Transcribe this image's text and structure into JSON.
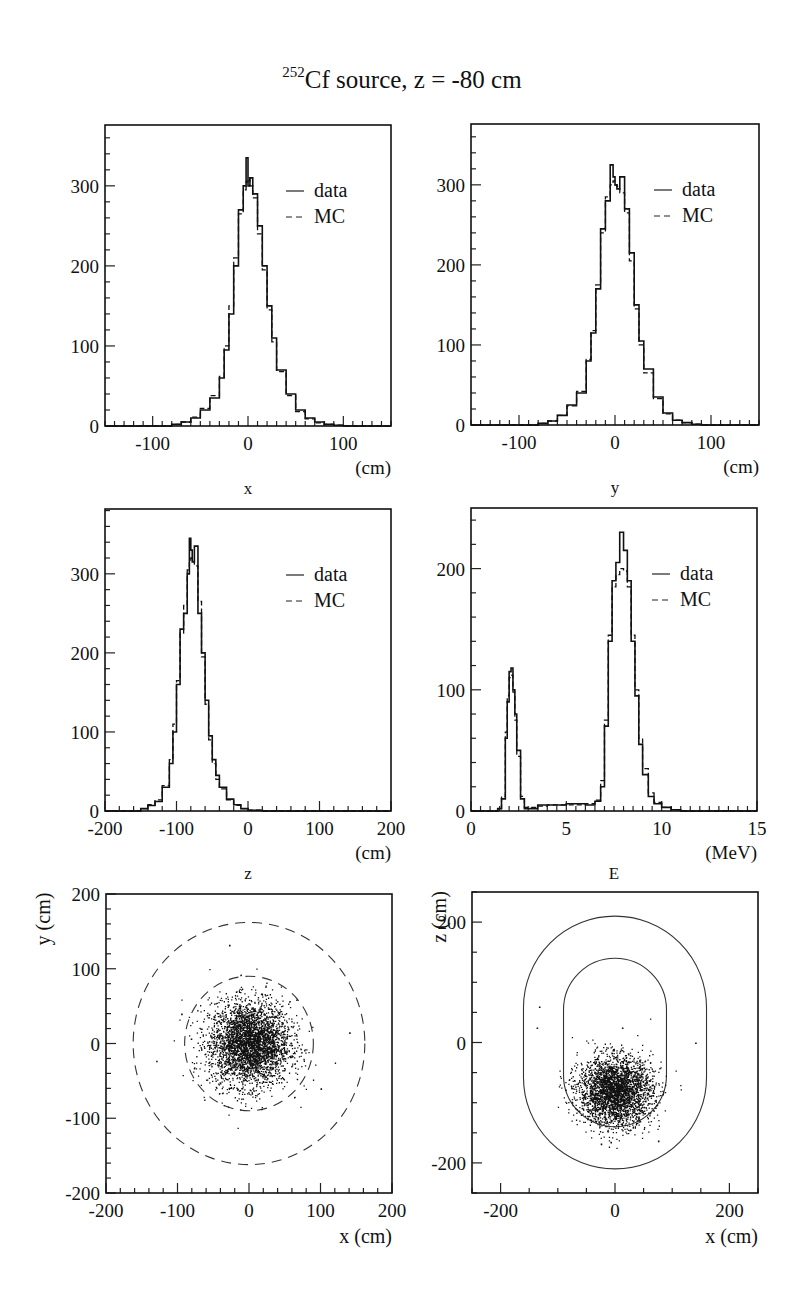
{
  "figure": {
    "title_superscript": "252",
    "title_main": "Cf source, z = -80 cm"
  },
  "chart_data": [
    {
      "id": "x",
      "type": "line",
      "subtype": "histogram",
      "title": "",
      "xlabel": "x",
      "xunit": "(cm)",
      "ylabel": "",
      "xlim": [
        -150,
        150
      ],
      "ylim": [
        0,
        376
      ],
      "xticks": [
        -100,
        0,
        100
      ],
      "yticks": [
        0,
        100,
        200,
        300
      ],
      "legend": [
        {
          "name": "data",
          "style": "solid"
        },
        {
          "name": "MC",
          "style": "dashed"
        }
      ],
      "legend_position": "upper right",
      "grid": false,
      "x": [
        -150,
        -90,
        -80,
        -70,
        -60,
        -50,
        -40,
        -30,
        -25,
        -20,
        -15,
        -10,
        -5,
        -2,
        0,
        2,
        5,
        10,
        15,
        20,
        25,
        30,
        40,
        50,
        60,
        70,
        80,
        90,
        100,
        150
      ],
      "series": [
        {
          "name": "data",
          "values": [
            0,
            0,
            2,
            5,
            10,
            20,
            35,
            60,
            95,
            140,
            200,
            270,
            300,
            335,
            300,
            310,
            290,
            250,
            200,
            150,
            110,
            70,
            40,
            20,
            10,
            5,
            2,
            1,
            0,
            0
          ]
        },
        {
          "name": "MC",
          "values": [
            0,
            0,
            2,
            5,
            11,
            22,
            38,
            62,
            100,
            150,
            210,
            265,
            295,
            305,
            310,
            300,
            285,
            240,
            195,
            145,
            105,
            68,
            38,
            18,
            9,
            4,
            2,
            1,
            0,
            0
          ]
        }
      ]
    },
    {
      "id": "y",
      "type": "line",
      "subtype": "histogram",
      "title": "",
      "xlabel": "y",
      "xunit": "(cm)",
      "ylabel": "",
      "xlim": [
        -150,
        150
      ],
      "ylim": [
        0,
        376
      ],
      "xticks": [
        -100,
        0,
        100
      ],
      "yticks": [
        0,
        100,
        200,
        300
      ],
      "legend": [
        {
          "name": "data",
          "style": "solid"
        },
        {
          "name": "MC",
          "style": "dashed"
        }
      ],
      "legend_position": "upper right",
      "grid": false,
      "x": [
        -150,
        -90,
        -80,
        -70,
        -60,
        -50,
        -40,
        -30,
        -25,
        -20,
        -15,
        -10,
        -5,
        -2,
        0,
        2,
        5,
        10,
        15,
        20,
        25,
        30,
        40,
        50,
        60,
        70,
        80,
        90,
        100,
        150
      ],
      "series": [
        {
          "name": "data",
          "values": [
            0,
            0,
            2,
            5,
            12,
            25,
            40,
            80,
            115,
            170,
            245,
            280,
            325,
            310,
            300,
            295,
            310,
            270,
            215,
            150,
            105,
            70,
            35,
            15,
            6,
            3,
            1,
            0,
            0,
            0
          ]
        },
        {
          "name": "MC",
          "values": [
            0,
            0,
            2,
            5,
            12,
            24,
            42,
            82,
            118,
            175,
            240,
            285,
            300,
            305,
            300,
            298,
            290,
            265,
            205,
            145,
            100,
            65,
            33,
            14,
            6,
            3,
            1,
            0,
            0,
            0
          ]
        }
      ]
    },
    {
      "id": "z",
      "type": "line",
      "subtype": "histogram",
      "title": "",
      "xlabel": "z",
      "xunit": "(cm)",
      "ylabel": "",
      "xlim": [
        -200,
        200
      ],
      "ylim": [
        0,
        382
      ],
      "xticks": [
        -200,
        -100,
        0,
        100,
        200
      ],
      "yticks": [
        0,
        100,
        200,
        300
      ],
      "legend": [
        {
          "name": "data",
          "style": "solid"
        },
        {
          "name": "MC",
          "style": "dashed"
        }
      ],
      "legend_position": "upper right",
      "grid": false,
      "x": [
        -200,
        -160,
        -150,
        -140,
        -130,
        -120,
        -110,
        -105,
        -100,
        -95,
        -90,
        -85,
        -82,
        -80,
        -78,
        -75,
        -70,
        -65,
        -60,
        -55,
        -50,
        -45,
        -40,
        -30,
        -20,
        -10,
        0,
        20,
        200
      ],
      "series": [
        {
          "name": "data",
          "values": [
            0,
            0,
            3,
            7,
            12,
            30,
            60,
            100,
            160,
            230,
            250,
            300,
            345,
            330,
            315,
            335,
            250,
            200,
            140,
            95,
            65,
            45,
            30,
            15,
            8,
            3,
            1,
            0,
            0
          ]
        },
        {
          "name": "MC",
          "values": [
            0,
            0,
            3,
            8,
            14,
            32,
            65,
            110,
            165,
            225,
            260,
            305,
            315,
            320,
            318,
            310,
            265,
            195,
            135,
            90,
            60,
            40,
            28,
            14,
            7,
            3,
            1,
            0,
            0
          ]
        }
      ]
    },
    {
      "id": "E",
      "type": "line",
      "subtype": "histogram",
      "title": "",
      "xlabel": "E",
      "xunit": "(MeV)",
      "ylabel": "",
      "xlim": [
        0,
        15
      ],
      "ylim": [
        0,
        250
      ],
      "xticks": [
        0,
        5,
        10,
        15
      ],
      "yticks": [
        0,
        100,
        200
      ],
      "legend": [
        {
          "name": "data",
          "style": "solid"
        },
        {
          "name": "MC",
          "style": "dashed"
        }
      ],
      "legend_position": "upper right",
      "grid": false,
      "x": [
        0,
        1.4,
        1.6,
        1.8,
        1.9,
        2.0,
        2.1,
        2.2,
        2.3,
        2.4,
        2.6,
        2.8,
        3.5,
        4,
        5,
        6,
        6.5,
        6.8,
        7.0,
        7.2,
        7.4,
        7.6,
        7.8,
        8.0,
        8.2,
        8.4,
        8.6,
        8.8,
        9.0,
        9.3,
        9.6,
        10,
        10.5,
        11,
        15
      ],
      "series": [
        {
          "name": "data",
          "values": [
            0,
            2,
            10,
            60,
            90,
            115,
            118,
            100,
            80,
            50,
            10,
            2,
            5,
            5,
            6,
            5,
            8,
            20,
            70,
            140,
            190,
            205,
            230,
            215,
            190,
            140,
            95,
            55,
            30,
            12,
            6,
            3,
            1,
            0,
            0
          ]
        },
        {
          "name": "MC",
          "values": [
            0,
            2,
            12,
            65,
            95,
            110,
            112,
            98,
            75,
            45,
            12,
            3,
            4,
            5,
            5,
            6,
            9,
            25,
            75,
            145,
            185,
            195,
            200,
            198,
            185,
            145,
            100,
            60,
            35,
            15,
            7,
            3,
            1,
            0,
            0
          ]
        }
      ]
    },
    {
      "id": "xy",
      "type": "scatter",
      "title": "",
      "xlabel": "x (cm)",
      "ylabel": "y (cm)",
      "xlim": [
        -200,
        200
      ],
      "ylim": [
        -200,
        200
      ],
      "xticks": [
        -200,
        -100,
        0,
        100,
        200
      ],
      "yticks": [
        -200,
        -100,
        0,
        100,
        200
      ],
      "grid": false,
      "cluster": {
        "center": [
          0,
          0
        ],
        "sigma": [
          28,
          28
        ],
        "n_points": 3500
      },
      "outliers": [
        [
          -28,
          132
        ],
        [
          -130,
          -23
        ],
        [
          140,
          15
        ],
        [
          100,
          -60
        ],
        [
          -95,
          40
        ]
      ],
      "overlays": [
        {
          "shape": "circle",
          "style": "dashed",
          "center": [
            0,
            0
          ],
          "radius": 162
        },
        {
          "shape": "circle",
          "style": "dashed",
          "center": [
            0,
            0
          ],
          "radius": 90
        }
      ]
    },
    {
      "id": "xz",
      "type": "scatter",
      "title": "",
      "xlabel": "x (cm)",
      "ylabel": "z (cm)",
      "xlim": [
        -250,
        250
      ],
      "ylim": [
        -250,
        250
      ],
      "xticks": [
        -200,
        0,
        200
      ],
      "yticks": [
        -200,
        0,
        200
      ],
      "grid": false,
      "cluster": {
        "center": [
          0,
          -80
        ],
        "sigma": [
          32,
          28
        ],
        "n_points": 3000
      },
      "outliers": [
        [
          -133,
          60
        ],
        [
          -137,
          25
        ],
        [
          12,
          25
        ],
        [
          140,
          0
        ],
        [
          75,
          -163
        ],
        [
          -25,
          -168
        ],
        [
          -8,
          -165
        ]
      ],
      "overlays": [
        {
          "shape": "stadium",
          "style": "solid",
          "half_width": 160,
          "half_height": 210
        },
        {
          "shape": "stadium",
          "style": "solid",
          "half_width": 90,
          "half_height": 140
        }
      ]
    }
  ]
}
